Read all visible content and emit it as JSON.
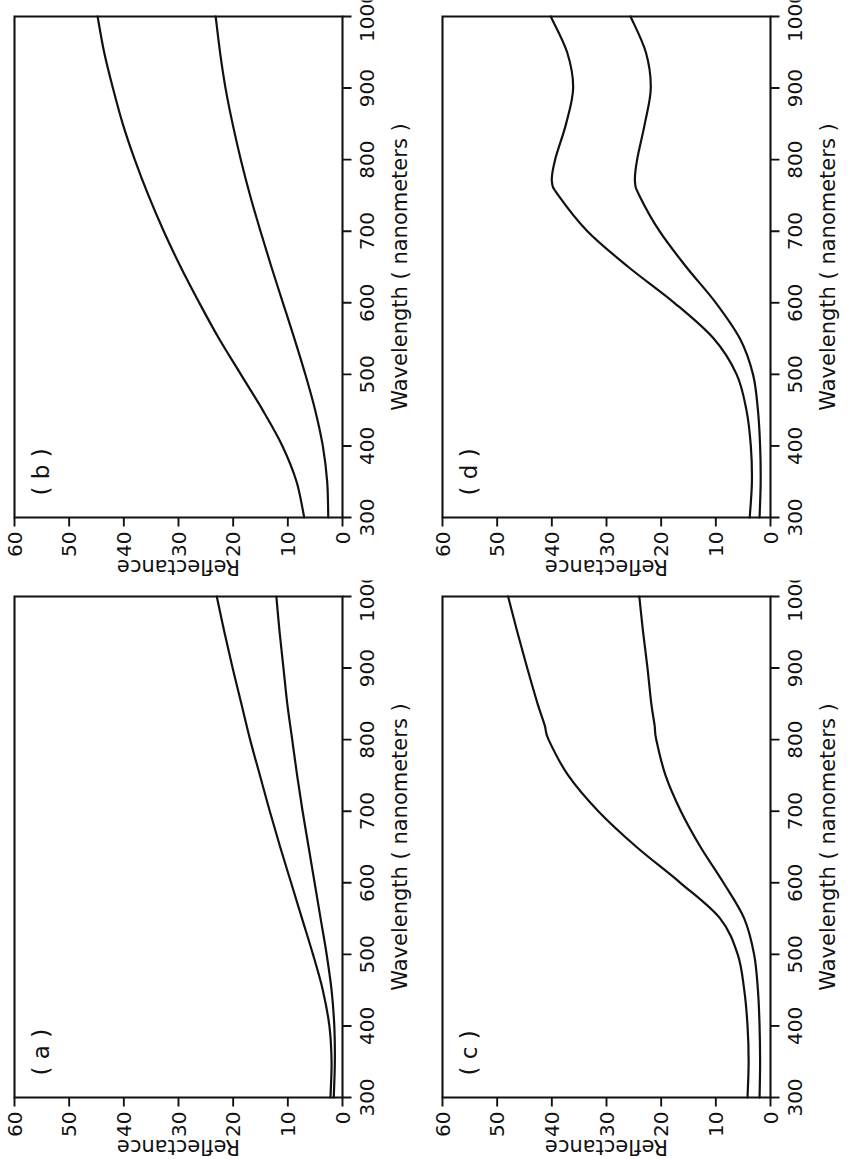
{
  "figure": {
    "panel_count": 4,
    "layout": "2x2 grid, each panel rotated 90 degrees counter-clockwise",
    "shared": {
      "xlabel": "Wavelength ( nanometers )",
      "ylabel": "Reflectance",
      "xticks": [
        "300",
        "400",
        "500",
        "600",
        "700",
        "800",
        "900",
        "1000"
      ],
      "yticks": [
        "0",
        "10",
        "20",
        "30",
        "40",
        "50",
        "60"
      ],
      "line_color": "#111111",
      "background_color": "#ffffff"
    }
  },
  "chart_data": [
    {
      "type": "line",
      "panel": "( a )",
      "title": "",
      "xlabel": "Wavelength ( nanometers )",
      "ylabel": "Reflectance",
      "xlim": [
        300,
        1000
      ],
      "ylim": [
        0,
        60
      ],
      "xticks": [
        300,
        400,
        500,
        600,
        700,
        800,
        900,
        1000
      ],
      "yticks": [
        0,
        10,
        20,
        30,
        40,
        50,
        60
      ],
      "grid": false,
      "legend": "none",
      "x": [
        300,
        350,
        400,
        450,
        500,
        550,
        600,
        650,
        700,
        750,
        800,
        850,
        900,
        950,
        1000
      ],
      "series": [
        {
          "name": "upper curve",
          "values": [
            2.2,
            2.0,
            2.4,
            3.6,
            5.4,
            7.4,
            9.4,
            11.4,
            13.3,
            15.1,
            16.9,
            18.5,
            20.1,
            21.6,
            23.0
          ]
        },
        {
          "name": "lower curve",
          "values": [
            1.6,
            1.4,
            1.5,
            2.0,
            2.9,
            4.0,
            5.1,
            6.2,
            7.3,
            8.3,
            9.2,
            10.1,
            10.8,
            11.5,
            12.1
          ]
        }
      ]
    },
    {
      "type": "line",
      "panel": "( b )",
      "title": "",
      "xlabel": "Wavelength ( nanometers )",
      "ylabel": "Reflectance",
      "xlim": [
        300,
        1000
      ],
      "ylim": [
        0,
        60
      ],
      "xticks": [
        300,
        400,
        500,
        600,
        700,
        800,
        900,
        1000
      ],
      "yticks": [
        0,
        10,
        20,
        30,
        40,
        50,
        60
      ],
      "grid": false,
      "legend": "none",
      "x": [
        300,
        350,
        400,
        450,
        500,
        550,
        600,
        650,
        700,
        750,
        800,
        850,
        900,
        950,
        1000
      ],
      "series": [
        {
          "name": "upper curve",
          "values": [
            7.0,
            8.4,
            11.0,
            14.6,
            18.6,
            22.6,
            26.2,
            29.6,
            32.7,
            35.5,
            38.0,
            40.2,
            42.0,
            43.6,
            44.8
          ]
        },
        {
          "name": "lower curve",
          "values": [
            2.6,
            2.8,
            3.6,
            5.0,
            6.8,
            8.8,
            10.9,
            13.0,
            15.0,
            16.9,
            18.6,
            20.1,
            21.4,
            22.4,
            23.2
          ]
        }
      ]
    },
    {
      "type": "line",
      "panel": "( c )",
      "title": "",
      "xlabel": "Wavelength ( nanometers )",
      "ylabel": "Reflectance",
      "xlim": [
        300,
        1000
      ],
      "ylim": [
        0,
        60
      ],
      "xticks": [
        300,
        400,
        500,
        600,
        700,
        800,
        900,
        1000
      ],
      "yticks": [
        0,
        10,
        20,
        30,
        40,
        50,
        60
      ],
      "grid": false,
      "legend": "none",
      "x": [
        300,
        350,
        400,
        450,
        500,
        550,
        600,
        650,
        700,
        750,
        800,
        820,
        850,
        900,
        950,
        1000
      ],
      "series": [
        {
          "name": "upper curve",
          "values": [
            4.2,
            4.0,
            4.2,
            4.8,
            6.0,
            9.2,
            16.5,
            24.5,
            31.5,
            37.0,
            40.6,
            41.3,
            42.6,
            44.5,
            46.3,
            48.0
          ]
        },
        {
          "name": "lower curve",
          "values": [
            2.0,
            1.9,
            2.0,
            2.3,
            3.0,
            4.8,
            8.6,
            12.8,
            16.4,
            19.2,
            20.9,
            21.2,
            21.8,
            22.5,
            23.3,
            24.0
          ]
        }
      ]
    },
    {
      "type": "line",
      "panel": "( d )",
      "title": "",
      "xlabel": "Wavelength ( nanometers )",
      "ylabel": "Reflectance",
      "xlim": [
        300,
        1000
      ],
      "ylim": [
        0,
        60
      ],
      "xticks": [
        300,
        400,
        500,
        600,
        700,
        800,
        900,
        1000
      ],
      "yticks": [
        0,
        10,
        20,
        30,
        40,
        50,
        60
      ],
      "grid": false,
      "legend": "none",
      "x": [
        300,
        350,
        400,
        450,
        500,
        550,
        600,
        650,
        700,
        750,
        770,
        800,
        850,
        900,
        950,
        1000
      ],
      "series": [
        {
          "name": "upper curve",
          "values": [
            3.8,
            3.4,
            3.6,
            4.4,
            6.2,
            10.4,
            17.6,
            26.0,
            33.5,
            38.8,
            40.0,
            39.4,
            37.4,
            36.1,
            37.2,
            40.2
          ]
        },
        {
          "name": "lower curve",
          "values": [
            2.0,
            1.8,
            1.9,
            2.3,
            3.2,
            5.6,
            10.0,
            15.4,
            20.3,
            24.0,
            24.8,
            24.4,
            23.0,
            21.9,
            22.8,
            25.6
          ]
        }
      ]
    }
  ]
}
